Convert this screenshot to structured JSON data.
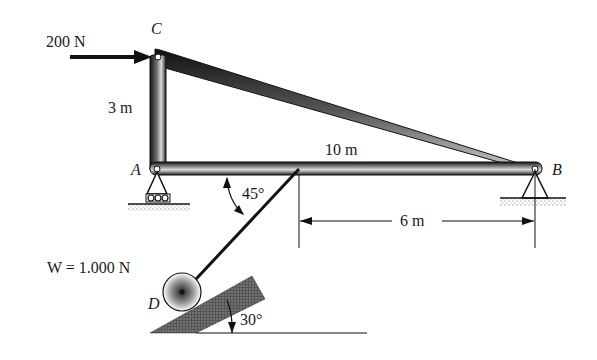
{
  "diagram": {
    "type": "statics-frame",
    "points": {
      "A": {
        "label": "A",
        "support": "roller"
      },
      "B": {
        "label": "B",
        "support": "pin"
      },
      "C": {
        "label": "C"
      },
      "D": {
        "label": "D",
        "description": "pulley/wheel on incline"
      }
    },
    "members": [
      "AC",
      "CB",
      "AB"
    ],
    "loads": {
      "horizontal_force": "200 N",
      "weight": "W = 1.000 N"
    },
    "dimensions": {
      "AC": "3 m",
      "AB": "10 m",
      "cable_to_B": "6 m"
    },
    "angles": {
      "cable_angle": "45°",
      "incline_angle": "30°"
    },
    "colors": {
      "ink": "#1a1a1a",
      "background": "#ffffff",
      "shade": "#8a8a8a"
    }
  }
}
